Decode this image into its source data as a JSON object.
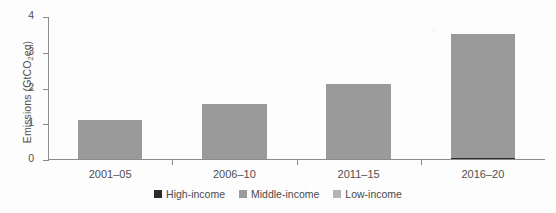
{
  "chart_data": {
    "type": "bar",
    "subtype": "stacked-bar",
    "title": "",
    "xlabel": "",
    "ylabel": "Emissions (GtCO2eq)",
    "ylabel_parts": {
      "prefix": "Emissions (GtCO",
      "sub": "2",
      "suffix": "eq)"
    },
    "categories": [
      "2001–05",
      "2006–10",
      "2011–15",
      "2016–20"
    ],
    "ylim": [
      0,
      4
    ],
    "yticks": [
      0,
      1,
      2,
      3,
      4
    ],
    "ytick_labels": [
      "0",
      "1",
      "2",
      "3",
      "4"
    ],
    "grid": false,
    "legend_position": "bottom-center",
    "series": [
      {
        "name": "High-income",
        "color": "#2b2b2b",
        "values": [
          0.0,
          0.0,
          0.0,
          0.03
        ]
      },
      {
        "name": "Middle-income",
        "color": "#9a9a9a",
        "values": [
          1.1,
          1.55,
          2.1,
          3.47
        ]
      },
      {
        "name": "Low-income",
        "color": "#b5b5b5",
        "values": [
          0.0,
          0.0,
          0.0,
          0.0
        ]
      }
    ],
    "totals": [
      1.1,
      1.55,
      2.1,
      3.5
    ],
    "axis_color": "#8c8c8c",
    "text_color": "#4f4f4f",
    "background": "#ffffff"
  },
  "legend": {
    "items": [
      {
        "label": "High-income",
        "color": "#2b2b2b"
      },
      {
        "label": "Middle-income",
        "color": "#9a9a9a"
      },
      {
        "label": "Low-income",
        "color": "#b5b5b5"
      }
    ]
  }
}
